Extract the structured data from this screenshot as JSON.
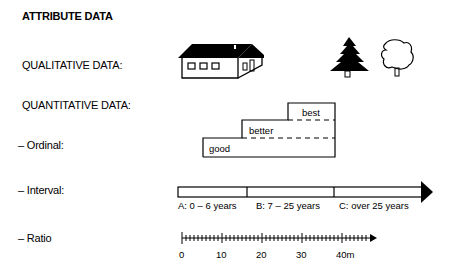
{
  "title": "ATTRIBUTE DATA",
  "rows": {
    "qualitative": "QUALITATIVE DATA:",
    "quantitative": "QUANTITATIVE DATA:",
    "ordinal": "– Ordinal:",
    "interval": "– Interval:",
    "ratio": "– Ratio"
  },
  "qualitative_icons": [
    "house-icon",
    "conifer-tree-icon",
    "deciduous-tree-icon"
  ],
  "ordinal_steps": [
    "good",
    "better",
    "best"
  ],
  "interval_classes": [
    "A: 0 – 6 years",
    "B: 7 – 25 years",
    "C: over 25 years"
  ],
  "ratio_scale": {
    "ticks": [
      "0",
      "10",
      "20",
      "30",
      "40m"
    ],
    "unit": "m"
  }
}
